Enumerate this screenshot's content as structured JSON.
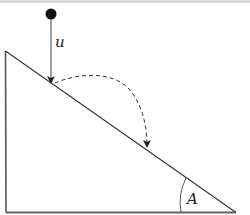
{
  "diagram": {
    "labels": {
      "velocity": "u",
      "angle": "A"
    },
    "colors": {
      "stroke": "#333333",
      "ball": "#111111",
      "top_strip": "#d9d9d9"
    },
    "elements": {
      "ball": "particle",
      "incline": "right-triangle wedge",
      "trajectory": "dashed parabolic bounce path"
    }
  }
}
